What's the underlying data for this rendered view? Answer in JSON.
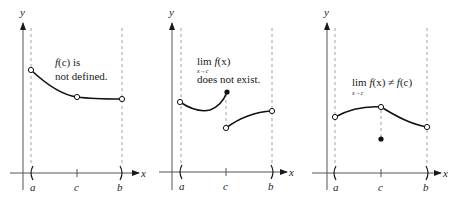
{
  "figure": {
    "panels": [
      {
        "axis_labels": {
          "x": "x",
          "y": "y"
        },
        "ticks": [
          "a",
          "c",
          "b"
        ],
        "annotation": {
          "line1_func": "f",
          "line1_arg": "(c)",
          "line1_rest": " is",
          "line2": "not defined."
        },
        "points": {
          "a_open": "open",
          "c_open": "open",
          "b_open": "open"
        }
      },
      {
        "axis_labels": {
          "x": "x",
          "y": "y"
        },
        "ticks": [
          "a",
          "c",
          "b"
        ],
        "annotation": {
          "lim": "lim",
          "func": "f",
          "arg": "(x)",
          "subscript": "x→c",
          "line2": "does not exist."
        },
        "points": {
          "a_open": "open",
          "c_left_closed": "closed",
          "c_right_open": "open",
          "b_open": "open"
        }
      },
      {
        "axis_labels": {
          "x": "x",
          "y": "y"
        },
        "ticks": [
          "a",
          "c",
          "b"
        ],
        "annotation": {
          "lim": "lim",
          "func": "f",
          "arg": "(x)",
          "neq": " ≠ ",
          "func2": "f",
          "arg2": "(c)",
          "subscript": "x→c"
        },
        "points": {
          "a_open": "open",
          "c_open": "open",
          "c_value": "closed",
          "b_open": "open"
        }
      }
    ]
  },
  "colors": {
    "ink": "#1a1a1a",
    "dash": "#8a8a8a",
    "background": "#ffffff"
  }
}
